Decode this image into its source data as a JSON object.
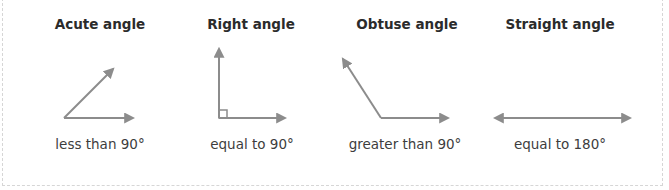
{
  "colors": {
    "stroke": "#8c8c8c",
    "title_text": "#2b2b2b",
    "caption_text": "#3d3d3d",
    "border": "#d6d6d6",
    "background": "#ffffff"
  },
  "angles": [
    {
      "id": "acute",
      "title": "Acute angle",
      "caption": "less than 90°"
    },
    {
      "id": "right",
      "title": "Right angle",
      "caption": "equal to 90°"
    },
    {
      "id": "obtuse",
      "title": "Obtuse angle",
      "caption": "greater than 90°"
    },
    {
      "id": "straight",
      "title": "Straight angle",
      "caption": "equal to 180°"
    }
  ]
}
